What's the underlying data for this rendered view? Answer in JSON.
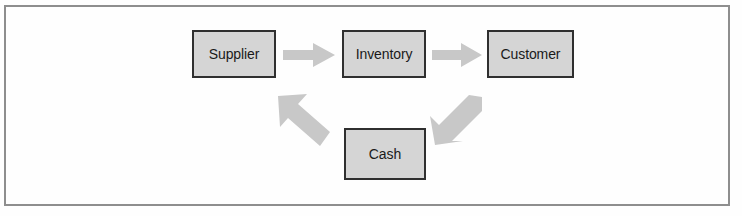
{
  "figure": {
    "background_color": "#ffffff",
    "frame_color": "#8e8e8e",
    "node_fill_color": "#d5d5d5",
    "node_border_color": "#2f2f2f",
    "arrow_color": "#c8c8c8",
    "label_color": "#1a1a1a"
  },
  "diagram": {
    "type": "flow-cycle",
    "nodes": [
      {
        "id": "supplier",
        "label": "Supplier"
      },
      {
        "id": "inventory",
        "label": "Inventory"
      },
      {
        "id": "customer",
        "label": "Customer"
      },
      {
        "id": "cash",
        "label": "Cash"
      }
    ],
    "arrows": [
      {
        "id": "supplier-to-inventory",
        "from": "supplier",
        "to": "inventory",
        "direction": "right",
        "icon": "right-arrow-icon"
      },
      {
        "id": "inventory-to-customer",
        "from": "inventory",
        "to": "customer",
        "direction": "right",
        "icon": "right-arrow-icon"
      },
      {
        "id": "customer-to-cash",
        "from": "customer",
        "to": "cash",
        "direction": "down-left",
        "icon": "down-left-arrow-icon"
      },
      {
        "id": "cash-to-supplier",
        "from": "cash",
        "to": "supplier",
        "direction": "up-left",
        "icon": "up-left-arrow-icon"
      }
    ]
  }
}
